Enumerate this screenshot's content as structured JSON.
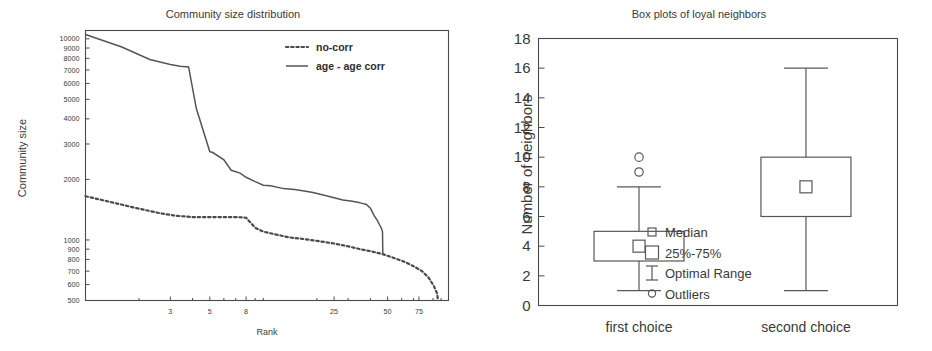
{
  "figure": {
    "background": "#ffffff",
    "line_color": "#555555",
    "text_color": "#3a3a3a"
  },
  "chart_data": [
    {
      "id": "community-size-distribution",
      "type": "line",
      "title": "Community size distribution",
      "xlabel": "Rank",
      "ylabel": "Community size",
      "xscale": "log",
      "yscale": "log",
      "xlim": [
        1,
        110
      ],
      "ylim": [
        500,
        11000
      ],
      "grid": false,
      "xticks": [
        3,
        5,
        8,
        25,
        50,
        75
      ],
      "xticklabels": [
        "3",
        "5",
        "8",
        "25",
        "50",
        "75"
      ],
      "yticks": [
        500,
        600,
        700,
        800,
        900,
        1000,
        2000,
        3000,
        4000,
        5000,
        6000,
        7000,
        8000,
        9000,
        10000
      ],
      "yticklabels": [
        "500",
        "600",
        "700",
        "800",
        "900",
        "1000",
        "2000",
        "3000",
        "4000",
        "5000",
        "6000",
        "7000",
        "8000",
        "9000",
        "10000"
      ],
      "legend_position": "upper right",
      "series": [
        {
          "name": "no-corr",
          "style": "dotted",
          "x": [
            1,
            1.4,
            2,
            2.6,
            3.2,
            4,
            5,
            6,
            7,
            8,
            9,
            10,
            12,
            14,
            17,
            20,
            25,
            30,
            35,
            40,
            47,
            55,
            62,
            70,
            78,
            85,
            91,
            95,
            96
          ],
          "y": [
            1650,
            1540,
            1430,
            1360,
            1320,
            1300,
            1300,
            1300,
            1300,
            1290,
            1150,
            1100,
            1060,
            1030,
            1010,
            990,
            960,
            930,
            900,
            880,
            850,
            810,
            780,
            740,
            700,
            650,
            590,
            540,
            500
          ]
        },
        {
          "name": "age - age corr",
          "style": "solid",
          "x": [
            1,
            1.6,
            2.3,
            3,
            3.4,
            3.8,
            4.2,
            5,
            5.2,
            6,
            6.6,
            7.4,
            8,
            9,
            10,
            11,
            13,
            15,
            17,
            19,
            22,
            25,
            28,
            31,
            34,
            36,
            38,
            40,
            42,
            44,
            45,
            46,
            46.8,
            47
          ],
          "y": [
            10500,
            9100,
            7900,
            7450,
            7300,
            7250,
            4500,
            2750,
            2720,
            2500,
            2220,
            2150,
            2050,
            1950,
            1870,
            1860,
            1800,
            1780,
            1750,
            1720,
            1670,
            1620,
            1580,
            1560,
            1540,
            1520,
            1500,
            1440,
            1320,
            1240,
            1190,
            1150,
            1100,
            850
          ]
        }
      ]
    },
    {
      "id": "box-plots-loyal-neighbors",
      "type": "boxplot",
      "title": "Box plots of loyal neighbors",
      "xlabel": "",
      "ylabel": "Number of neighbors",
      "ylim": [
        0,
        18
      ],
      "grid": false,
      "yticks": [
        0,
        2,
        4,
        6,
        8,
        10,
        12,
        14,
        16,
        18
      ],
      "yticklabels": [
        "0",
        "2",
        "4",
        "6",
        "8",
        "10",
        "12",
        "14",
        "16",
        "18"
      ],
      "categories": [
        "first choice",
        "second choice"
      ],
      "boxes": [
        {
          "category": "first choice",
          "whisker_low": 1,
          "q1": 3,
          "median": 4,
          "q3": 5,
          "whisker_high": 8,
          "outliers": [
            9,
            10
          ]
        },
        {
          "category": "second choice",
          "whisker_low": 1,
          "q1": 6,
          "median": 8,
          "q3": 10,
          "whisker_high": 16,
          "outliers": []
        }
      ],
      "legend_position": "center",
      "legend_entries": [
        {
          "marker": "small-square",
          "label": "Median"
        },
        {
          "marker": "large-square",
          "label": "25%-75%"
        },
        {
          "marker": "i-beam",
          "label": "Optimal Range"
        },
        {
          "marker": "circle",
          "label": "Outliers"
        }
      ]
    }
  ]
}
